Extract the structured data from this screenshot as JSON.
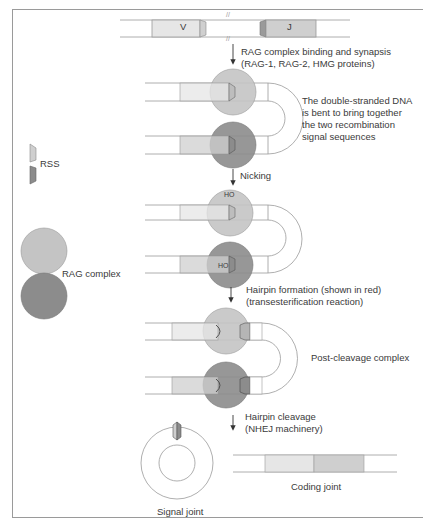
{
  "colors": {
    "rag_light": "#c4c4c4",
    "rag_dark": "#8c8c8c",
    "segment_v": "#e6e6e6",
    "segment_j": "#cfcfcf",
    "line": "#9a9a9a",
    "text": "#3a3a3a"
  },
  "legend": {
    "rss_label": "RSS",
    "rag_label": "RAG complex"
  },
  "steps": {
    "initial": {
      "v_label": "V",
      "j_label": "J"
    },
    "step1_label_line1": "RAG complex binding and synapsis",
    "step1_label_line2": "(RAG-1, RAG-2, HMG proteins)",
    "synapsis_note_line1": "The double-stranded DNA",
    "synapsis_note_line2": "is bent to bring together",
    "synapsis_note_line3": "the two recombination",
    "synapsis_note_line4": "signal sequences",
    "step2_label": "Nicking",
    "ho_top": "HO",
    "ho_bottom": "HO",
    "step3_label_line1": "Hairpin formation (shown in red)",
    "step3_label_line2": "(transesterification reaction)",
    "post_cleavage_label": "Post-cleavage complex",
    "step4_label_line1": "Hairpin cleavage",
    "step4_label_line2": "(NHEJ machinery)",
    "signal_joint_label": "Signal joint",
    "coding_joint_label": "Coding joint"
  }
}
